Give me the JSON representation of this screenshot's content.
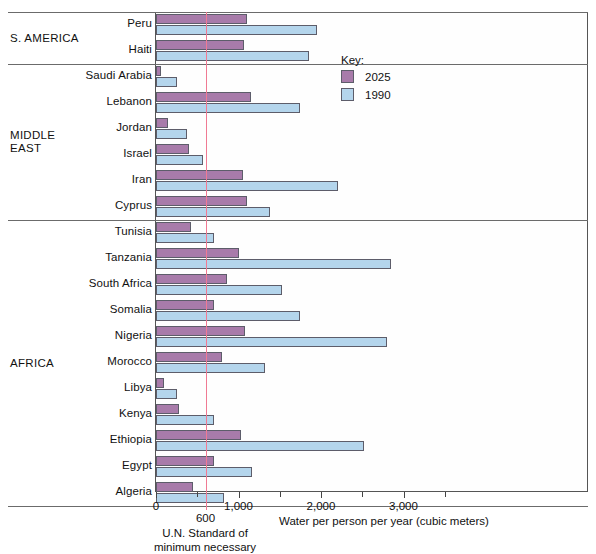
{
  "chart_data": {
    "type": "bar",
    "orientation": "horizontal",
    "title": "",
    "xlabel": "Water per person per year (cubic meters)",
    "ylabel": "",
    "xlim": [
      0,
      3500
    ],
    "xticks": [
      0,
      1000,
      2000,
      3000
    ],
    "xticklabels": [
      "0",
      "1,000",
      "2,000",
      "3,000"
    ],
    "grid": false,
    "legend": {
      "title": "Key:",
      "position": "inside-top-right",
      "entries": [
        {
          "name": "2025",
          "color": "#a87baa"
        },
        {
          "name": "1990",
          "color": "#b4d5ec"
        }
      ]
    },
    "annotations": [
      {
        "name": "un-standard",
        "value": 600,
        "label": "600",
        "caption": "U.N. Standard of\nminimum necessary",
        "color": "#f07a93"
      }
    ],
    "series": [
      {
        "name": "2025",
        "color": "#a87baa"
      },
      {
        "name": "1990",
        "color": "#b4d5ec"
      }
    ],
    "groups": [
      {
        "name": "S. AMERICA",
        "countries": [
          {
            "label": "Peru",
            "y2025": 1100,
            "y1990": 1950
          },
          {
            "label": "Haiti",
            "y2025": 1070,
            "y1990": 1850
          }
        ]
      },
      {
        "name": "MIDDLE\nEAST",
        "countries": [
          {
            "label": "Saudi Arabia",
            "y2025": 60,
            "y1990": 250
          },
          {
            "label": "Lebanon",
            "y2025": 1150,
            "y1990": 1750
          },
          {
            "label": "Jordan",
            "y2025": 150,
            "y1990": 370
          },
          {
            "label": "Israel",
            "y2025": 400,
            "y1990": 570
          },
          {
            "label": "Iran",
            "y2025": 1050,
            "y1990": 2200
          },
          {
            "label": "Cyprus",
            "y2025": 1100,
            "y1990": 1380
          }
        ]
      },
      {
        "name": "AFRICA",
        "countries": [
          {
            "label": "Tunisia",
            "y2025": 430,
            "y1990": 700
          },
          {
            "label": "Tanzania",
            "y2025": 1000,
            "y1990": 2850
          },
          {
            "label": "South Africa",
            "y2025": 860,
            "y1990": 1530
          },
          {
            "label": "Somalia",
            "y2025": 700,
            "y1990": 1740
          },
          {
            "label": "Nigeria",
            "y2025": 1080,
            "y1990": 2800
          },
          {
            "label": "Morocco",
            "y2025": 800,
            "y1990": 1320
          },
          {
            "label": "Libya",
            "y2025": 100,
            "y1990": 250
          },
          {
            "label": "Kenya",
            "y2025": 280,
            "y1990": 700
          },
          {
            "label": "Ethiopia",
            "y2025": 1030,
            "y1990": 2520
          },
          {
            "label": "Egypt",
            "y2025": 700,
            "y1990": 1160
          },
          {
            "label": "Algeria",
            "y2025": 450,
            "y1990": 820
          }
        ]
      }
    ]
  }
}
